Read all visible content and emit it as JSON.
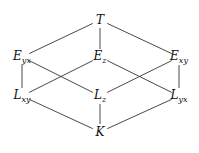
{
  "diagram": {
    "type": "hasse-lattice",
    "nodes": [
      {
        "id": "T",
        "base": "T",
        "sub": "",
        "x": 100,
        "y": 20
      },
      {
        "id": "E_yx",
        "base": "E",
        "sub": "yx",
        "x": 22,
        "y": 57
      },
      {
        "id": "E_z",
        "base": "E",
        "sub": "z",
        "x": 100,
        "y": 57
      },
      {
        "id": "E_xy",
        "base": "E",
        "sub": "xy",
        "x": 179,
        "y": 57
      },
      {
        "id": "L_xy",
        "base": "L",
        "sub": "xy",
        "x": 22,
        "y": 96
      },
      {
        "id": "L_z",
        "base": "L",
        "sub": "z",
        "x": 100,
        "y": 96
      },
      {
        "id": "L_yx",
        "base": "L",
        "sub": "yx",
        "x": 179,
        "y": 96
      },
      {
        "id": "K",
        "base": "K",
        "sub": "",
        "x": 100,
        "y": 132
      }
    ],
    "edges": [
      [
        "T",
        "E_yx"
      ],
      [
        "T",
        "E_z"
      ],
      [
        "T",
        "E_xy"
      ],
      [
        "E_yx",
        "L_xy"
      ],
      [
        "E_yx",
        "L_z"
      ],
      [
        "E_z",
        "L_xy"
      ],
      [
        "E_z",
        "L_yx"
      ],
      [
        "E_xy",
        "L_z"
      ],
      [
        "E_xy",
        "L_yx"
      ],
      [
        "L_xy",
        "K"
      ],
      [
        "L_z",
        "K"
      ],
      [
        "L_yx",
        "K"
      ]
    ],
    "line_color": "#333333"
  }
}
